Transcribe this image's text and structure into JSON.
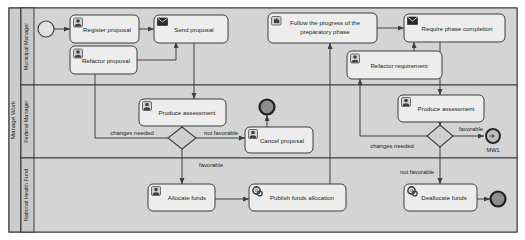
{
  "diagram": {
    "type": "bpmn-collaboration",
    "pool": {
      "name": "Manage Work"
    },
    "colors": {
      "background": "#ffffff",
      "pool_fill": "#d4d4d4",
      "lane_header_fill": "#c8c8c8",
      "task_fill": "#ededed",
      "gateway_fill": "#d0d0d0",
      "event_fill": "#d8d8d8",
      "stroke": "#3f3f3f",
      "text": "#222222"
    },
    "lanes": [
      {
        "id": "lane-municipal-manager",
        "label": "Municipal Manager"
      },
      {
        "id": "lane-federal-manager",
        "label": "Federal Manager"
      },
      {
        "id": "lane-national-health-fund",
        "label": "National Health Fund"
      }
    ],
    "events": [
      {
        "id": "start-event",
        "kind": "start",
        "label": "",
        "icon": "start-event-circle"
      },
      {
        "id": "end-event-cancel",
        "kind": "end",
        "label": "",
        "icon": "end-event-circle"
      },
      {
        "id": "end-event-mw1",
        "kind": "end-link",
        "label": "MW1",
        "icon": "link-end-event"
      },
      {
        "id": "end-event-deallocate",
        "kind": "end",
        "label": "",
        "icon": "end-event-circle"
      }
    ],
    "tasks": [
      {
        "id": "task-register-proposal",
        "label": "Register proposal",
        "icon": "user-task-icon",
        "lane": "lane-municipal-manager"
      },
      {
        "id": "task-send-proposal",
        "label": "Send proposal",
        "icon": "send-task-icon",
        "lane": "lane-municipal-manager"
      },
      {
        "id": "task-refactor-proposal",
        "label": "Refactor proposal",
        "icon": "user-task-icon",
        "lane": "lane-municipal-manager"
      },
      {
        "id": "task-follow-progress",
        "label": "Follow the progress of the preparatory phase",
        "label_line1": "Follow the progress of the",
        "label_line2": "preparatory phase",
        "icon": "manual-task-icon",
        "lane": "lane-municipal-manager"
      },
      {
        "id": "task-require-phase-completion",
        "label": "Require phase completion",
        "icon": "send-task-icon",
        "lane": "lane-municipal-manager"
      },
      {
        "id": "task-produce-assessment-left",
        "label": "Produce assessment",
        "icon": "user-task-icon",
        "lane": "lane-federal-manager"
      },
      {
        "id": "task-cancel-proposal",
        "label": "Cancel proposal",
        "icon": "user-task-icon",
        "lane": "lane-federal-manager"
      },
      {
        "id": "task-refactor-requirement",
        "label": "Refactor requirement",
        "icon": "user-task-icon",
        "lane": "lane-federal-manager"
      },
      {
        "id": "task-produce-assessment-right",
        "label": "Produce assessment",
        "icon": "user-task-icon",
        "lane": "lane-federal-manager"
      },
      {
        "id": "task-allocate-funds",
        "label": "Allocate funds",
        "icon": "user-task-icon",
        "lane": "lane-national-health-fund"
      },
      {
        "id": "task-publish-funds-allocation",
        "label": "Publish funds allocation",
        "icon": "service-task-icon",
        "lane": "lane-national-health-fund"
      },
      {
        "id": "task-deallocate-funds",
        "label": "Deallocate funds",
        "icon": "service-task-icon",
        "lane": "lane-national-health-fund"
      }
    ],
    "gateways": [
      {
        "id": "gateway-left",
        "kind": "exclusive",
        "label": ""
      },
      {
        "id": "gateway-right",
        "kind": "exclusive",
        "label": ""
      }
    ],
    "flow_labels": [
      {
        "id": "flow-label-changes-needed-left",
        "text": "changes needed"
      },
      {
        "id": "flow-label-not-favorable-left",
        "text": "not favorable"
      },
      {
        "id": "flow-label-favorable-left",
        "text": "favorable"
      },
      {
        "id": "flow-label-changes-needed-right",
        "text": "changes needed"
      },
      {
        "id": "flow-label-favorable-right",
        "text": "favorable"
      },
      {
        "id": "flow-label-not-favorable-right",
        "text": "not favorable"
      }
    ]
  }
}
